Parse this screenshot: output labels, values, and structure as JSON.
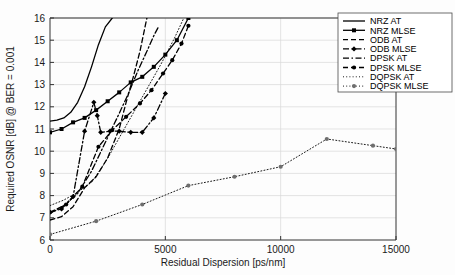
{
  "chart_data": {
    "type": "line",
    "title": "",
    "xlabel": "Residual Dispersion [ps/nm]",
    "ylabel": "Required OSNR [dB] @ BER = 0.001",
    "xlim": [
      0,
      15000
    ],
    "ylim": [
      6,
      16
    ],
    "xticks": [
      0,
      5000,
      10000,
      15000
    ],
    "xtick_labels": [
      "0",
      "5000",
      "10000",
      "15000"
    ],
    "yticks": [
      6,
      7,
      8,
      9,
      10,
      11,
      12,
      13,
      14,
      15,
      16
    ],
    "ytick_labels": [
      "6",
      "7",
      "8",
      "9",
      "10",
      "11",
      "12",
      "13",
      "14",
      "15",
      "16"
    ],
    "grid": true,
    "legend_position": "top-right",
    "series": [
      {
        "name": "NRZ AT",
        "style": "solid",
        "marker": "none",
        "color": "#000000",
        "x": [
          0,
          300,
          600,
          900,
          1200,
          1500,
          1800,
          2100,
          2400,
          2700
        ],
        "y": [
          11.35,
          11.4,
          11.5,
          11.75,
          12.2,
          12.9,
          13.8,
          14.8,
          15.6,
          16.0
        ]
      },
      {
        "name": "NRZ MLSE",
        "style": "solid",
        "marker": "square",
        "color": "#000000",
        "x": [
          0,
          500,
          1000,
          1500,
          2000,
          2500,
          3000,
          3500,
          4000,
          4500,
          5000,
          5500,
          6000
        ],
        "y": [
          10.85,
          11.0,
          11.3,
          11.5,
          11.85,
          12.25,
          12.65,
          13.1,
          13.35,
          13.8,
          14.35,
          15.0,
          16.0
        ]
      },
      {
        "name": "ODB AT",
        "style": "dashed",
        "marker": "none",
        "color": "#000000",
        "x": [
          0,
          500,
          1000,
          1500,
          2000,
          2500,
          3000,
          3300,
          3600,
          3900,
          4100,
          4200
        ],
        "y": [
          6.9,
          7.05,
          7.5,
          8.35,
          8.85,
          9.7,
          11.0,
          12.2,
          13.3,
          14.5,
          15.5,
          16.0
        ]
      },
      {
        "name": "ODB MLSE",
        "style": "dash-dot",
        "marker": "diamond",
        "color": "#000000",
        "x": [
          0,
          500,
          1000,
          1500,
          1900,
          2050,
          2200,
          2600,
          3000,
          3500,
          4000,
          4500,
          5000
        ],
        "y": [
          7.25,
          7.4,
          7.95,
          10.9,
          12.2,
          11.6,
          10.85,
          10.9,
          10.9,
          10.85,
          10.85,
          11.5,
          12.6
        ]
      },
      {
        "name": "DPSK AT",
        "style": "dash-dot",
        "marker": "none",
        "color": "#000000",
        "x": [
          0,
          600,
          1200,
          1800,
          2400,
          3000,
          3400,
          3800,
          4200,
          4500,
          4700
        ],
        "y": [
          7.2,
          7.55,
          8.1,
          9.1,
          10.4,
          11.7,
          12.6,
          13.6,
          14.5,
          15.2,
          15.6
        ]
      },
      {
        "name": "DPSK MLSE",
        "style": "dashed",
        "marker": "circle",
        "color": "#000000",
        "x": [
          0,
          700,
          1400,
          2100,
          2700,
          3300,
          3900,
          4400,
          4900,
          5300,
          5700,
          6000
        ],
        "y": [
          7.25,
          7.6,
          8.4,
          10.2,
          10.95,
          11.55,
          12.15,
          12.75,
          13.5,
          14.1,
          14.85,
          15.65
        ]
      },
      {
        "name": "DQPSK AT",
        "style": "dotted",
        "marker": "none",
        "color": "#8a8a8a",
        "x": [
          0,
          600,
          1200,
          1800,
          2400,
          3000,
          3600,
          4200,
          4800,
          5400,
          5800
        ],
        "y": [
          7.55,
          7.8,
          8.15,
          8.6,
          9.5,
          10.6,
          11.7,
          12.8,
          13.9,
          15.1,
          16.0
        ]
      },
      {
        "name": "DQPSK MLSE",
        "style": "dotted",
        "marker": "circle",
        "color": "#6e6e6e",
        "x": [
          0,
          2000,
          4000,
          6000,
          8000,
          10000,
          12000,
          14000,
          15000
        ],
        "y": [
          6.25,
          6.85,
          7.6,
          8.45,
          8.85,
          9.3,
          10.55,
          10.25,
          10.1
        ]
      }
    ]
  },
  "legend": {
    "entries": [
      {
        "label": "NRZ AT"
      },
      {
        "label": "NRZ MLSE"
      },
      {
        "label": "ODB AT"
      },
      {
        "label": "ODB MLSE"
      },
      {
        "label": "DPSK AT"
      },
      {
        "label": "DPSK MLSE"
      },
      {
        "label": "DQPSK AT"
      },
      {
        "label": "DQPSK MLSE"
      }
    ]
  }
}
